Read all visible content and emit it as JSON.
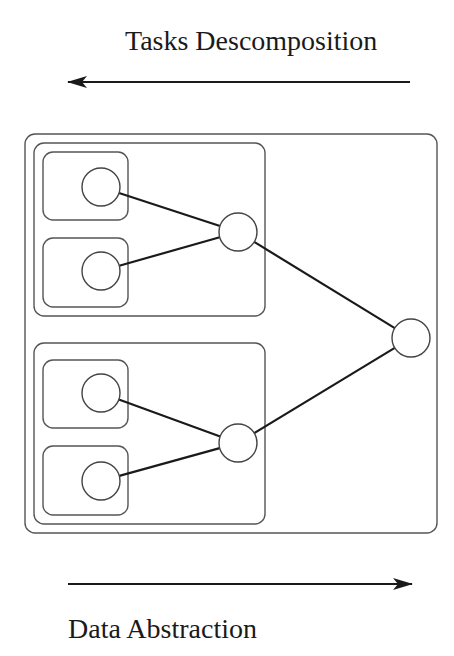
{
  "top_label": "Tasks Descomposition",
  "bottom_label": "Data Abstraction",
  "top_arrow": {
    "direction": "left",
    "x1": 410,
    "x2": 68,
    "y": 82
  },
  "bottom_arrow": {
    "direction": "right",
    "x1": 68,
    "x2": 412,
    "y": 584
  },
  "outer_box": {
    "x": 25,
    "y": 134,
    "w": 412,
    "h": 399
  },
  "groups": [
    {
      "box": {
        "x": 34,
        "y": 143,
        "w": 231,
        "h": 173
      },
      "leaves": [
        {
          "box": {
            "x": 43,
            "y": 152,
            "w": 85,
            "h": 68
          },
          "node": {
            "cx": 101,
            "cy": 187
          }
        },
        {
          "box": {
            "x": 43,
            "y": 238,
            "w": 85,
            "h": 69
          },
          "node": {
            "cx": 101,
            "cy": 271
          }
        }
      ],
      "hub": {
        "cx": 238,
        "cy": 232
      }
    },
    {
      "box": {
        "x": 34,
        "y": 343,
        "w": 231,
        "h": 181
      },
      "leaves": [
        {
          "box": {
            "x": 43,
            "y": 360,
            "w": 85,
            "h": 68
          },
          "node": {
            "cx": 101,
            "cy": 393
          }
        },
        {
          "box": {
            "x": 43,
            "y": 446,
            "w": 85,
            "h": 69
          },
          "node": {
            "cx": 101,
            "cy": 481
          }
        }
      ],
      "hub": {
        "cx": 238,
        "cy": 443
      }
    }
  ],
  "root": {
    "cx": 411,
    "cy": 338
  },
  "node_radius": 19
}
